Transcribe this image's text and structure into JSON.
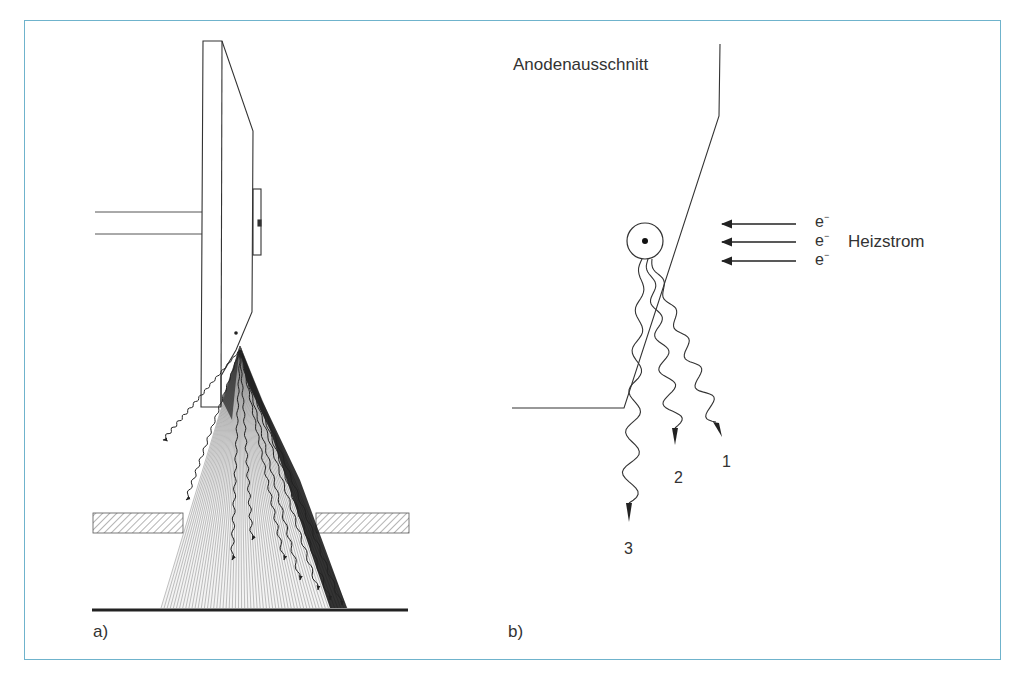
{
  "figure": {
    "frame_color": "#6fb3cc",
    "panel_a": {
      "label": "a)",
      "description": "Rotating anode x-ray tube cross-section with diverging x-ray beam through collimator aperture to image plane"
    },
    "panel_b": {
      "label": "b)",
      "anode_label": "Anodenausschnitt",
      "heating_current_label": "Heizstrom",
      "electron_symbol": "e",
      "electron_charge": "−",
      "electron_count": 3,
      "ray_labels": [
        "1",
        "2",
        "3"
      ]
    }
  }
}
